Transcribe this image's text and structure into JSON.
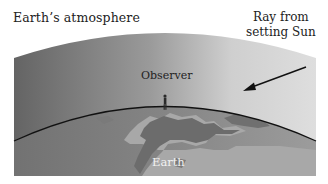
{
  "figure": {
    "labels": {
      "atmosphere": "Earth’s atmosphere",
      "ray_line1": "Ray from",
      "ray_line2": "setting Sun",
      "observer": "Observer",
      "earth": "Earth"
    },
    "colors": {
      "background": "#ffffff",
      "atmosphere_dark": "#6a6a6a",
      "atmosphere_light": "#dcdcdc",
      "earth_ocean": "#8f8f8f",
      "earth_land_dark": "#6f6f6f",
      "earth_land_light": "#a9a9a9",
      "horizon_line": "#111111",
      "arrow": "#111111",
      "text": "#222222",
      "earth_label": "#f2f2f2"
    }
  }
}
